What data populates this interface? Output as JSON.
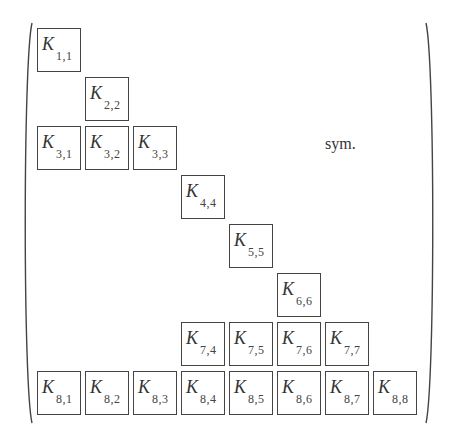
{
  "matrix": {
    "symbol": "K",
    "symmetry_label": "sym.",
    "blocks": [
      {
        "row": 1,
        "col": 1,
        "sub": "1,1"
      },
      {
        "row": 2,
        "col": 2,
        "sub": "2,2"
      },
      {
        "row": 3,
        "col": 1,
        "sub": "3,1"
      },
      {
        "row": 3,
        "col": 2,
        "sub": "3,2"
      },
      {
        "row": 3,
        "col": 3,
        "sub": "3,3"
      },
      {
        "row": 4,
        "col": 4,
        "sub": "4,4"
      },
      {
        "row": 5,
        "col": 5,
        "sub": "5,5"
      },
      {
        "row": 6,
        "col": 6,
        "sub": "6,6"
      },
      {
        "row": 7,
        "col": 4,
        "sub": "7,4"
      },
      {
        "row": 7,
        "col": 5,
        "sub": "7,5"
      },
      {
        "row": 7,
        "col": 6,
        "sub": "7,6"
      },
      {
        "row": 7,
        "col": 7,
        "sub": "7,7"
      },
      {
        "row": 8,
        "col": 1,
        "sub": "8,1"
      },
      {
        "row": 8,
        "col": 2,
        "sub": "8,2"
      },
      {
        "row": 8,
        "col": 3,
        "sub": "8,3"
      },
      {
        "row": 8,
        "col": 4,
        "sub": "8,4"
      },
      {
        "row": 8,
        "col": 5,
        "sub": "8,5"
      },
      {
        "row": 8,
        "col": 6,
        "sub": "8,6"
      },
      {
        "row": 8,
        "col": 7,
        "sub": "8,7"
      },
      {
        "row": 8,
        "col": 8,
        "sub": "8,8"
      }
    ]
  }
}
